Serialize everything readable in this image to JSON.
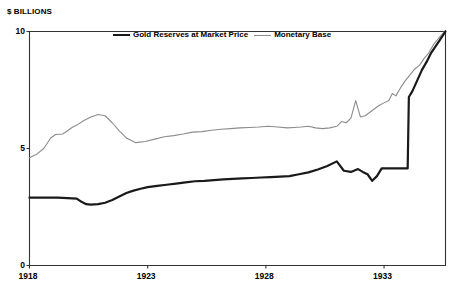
{
  "chart_data": {
    "type": "line",
    "title": "",
    "subtitle": "",
    "ylabel": "$ BILLIONS",
    "xlabel": "",
    "ylim": [
      0,
      10
    ],
    "xlim": [
      1918,
      1935.6
    ],
    "grid": false,
    "legend_position": "top-center",
    "y_ticks": [
      "0",
      "5",
      "10"
    ],
    "y_tick_values": [
      0,
      5,
      10
    ],
    "x_ticks": [
      "1918",
      "1923",
      "1928",
      "1933"
    ],
    "x_tick_values": [
      1918,
      1923,
      1928,
      1933
    ],
    "colors": {
      "gold_line": "#1a1a1a",
      "monetary_base_line": "#8c8c8c",
      "axis": "#333333",
      "background": "#ffffff"
    },
    "series": [
      {
        "name": "Gold Reserves at Market Price",
        "color": "#1a1a1a",
        "width": 2.2,
        "x": [
          1918.0,
          1918.4,
          1918.8,
          1919.2,
          1919.6,
          1920.0,
          1920.2,
          1920.4,
          1920.6,
          1920.9,
          1921.2,
          1921.5,
          1921.8,
          1922.1,
          1922.4,
          1922.7,
          1923.0,
          1923.4,
          1923.8,
          1924.2,
          1924.6,
          1925.0,
          1925.4,
          1925.8,
          1926.2,
          1926.6,
          1927.0,
          1927.4,
          1927.8,
          1928.2,
          1928.6,
          1929.0,
          1929.4,
          1929.8,
          1930.2,
          1930.6,
          1931.0,
          1931.3,
          1931.6,
          1931.9,
          1932.1,
          1932.3,
          1932.5,
          1932.7,
          1932.9,
          1933.1,
          1933.3,
          1933.5,
          1933.7,
          1933.9,
          1934.0,
          1934.05,
          1934.2,
          1934.4,
          1934.6,
          1934.8,
          1935.0,
          1935.2,
          1935.4,
          1935.6
        ],
        "values": [
          2.9,
          2.9,
          2.9,
          2.9,
          2.88,
          2.86,
          2.72,
          2.62,
          2.6,
          2.62,
          2.68,
          2.8,
          2.95,
          3.1,
          3.2,
          3.28,
          3.35,
          3.4,
          3.45,
          3.5,
          3.55,
          3.6,
          3.62,
          3.65,
          3.68,
          3.7,
          3.72,
          3.74,
          3.76,
          3.78,
          3.8,
          3.82,
          3.9,
          3.98,
          4.1,
          4.25,
          4.45,
          4.05,
          4.0,
          4.12,
          4.0,
          3.9,
          3.62,
          3.82,
          4.15,
          4.15,
          4.15,
          4.15,
          4.15,
          4.15,
          4.15,
          7.2,
          7.45,
          7.9,
          8.35,
          8.7,
          9.1,
          9.4,
          9.7,
          10.0
        ]
      },
      {
        "name": "Monetary Base",
        "color": "#8c8c8c",
        "width": 1.1,
        "x": [
          1918.0,
          1918.3,
          1918.6,
          1918.9,
          1919.1,
          1919.4,
          1919.6,
          1919.8,
          1920.0,
          1920.3,
          1920.6,
          1920.9,
          1921.2,
          1921.5,
          1921.8,
          1922.1,
          1922.5,
          1922.9,
          1923.3,
          1923.7,
          1924.1,
          1924.5,
          1924.9,
          1925.3,
          1925.7,
          1926.1,
          1926.5,
          1926.9,
          1927.3,
          1927.7,
          1928.1,
          1928.5,
          1928.9,
          1929.2,
          1929.5,
          1929.8,
          1930.1,
          1930.4,
          1930.7,
          1931.0,
          1931.2,
          1931.4,
          1931.6,
          1931.8,
          1932.0,
          1932.2,
          1932.4,
          1932.6,
          1932.8,
          1933.0,
          1933.2,
          1933.35,
          1933.5,
          1933.7,
          1933.9,
          1934.1,
          1934.3,
          1934.5,
          1934.7,
          1934.9,
          1935.1,
          1935.3,
          1935.6
        ],
        "values": [
          4.6,
          4.75,
          5.0,
          5.45,
          5.6,
          5.62,
          5.75,
          5.9,
          6.0,
          6.2,
          6.35,
          6.45,
          6.4,
          6.1,
          5.75,
          5.45,
          5.25,
          5.3,
          5.4,
          5.5,
          5.55,
          5.62,
          5.7,
          5.72,
          5.78,
          5.82,
          5.85,
          5.88,
          5.9,
          5.92,
          5.95,
          5.92,
          5.88,
          5.9,
          5.92,
          5.95,
          5.88,
          5.85,
          5.88,
          5.95,
          6.15,
          6.1,
          6.3,
          7.05,
          6.35,
          6.4,
          6.55,
          6.7,
          6.85,
          6.95,
          7.05,
          7.35,
          7.25,
          7.6,
          7.9,
          8.15,
          8.4,
          8.55,
          8.85,
          9.1,
          9.45,
          9.7,
          10.05
        ]
      }
    ]
  },
  "legend": {
    "items": [
      {
        "label": "Gold Reserves at Market Price",
        "swatch": "gold-line-swatch"
      },
      {
        "label": "Monetary Base",
        "swatch": "monetary-base-line-swatch"
      }
    ]
  }
}
